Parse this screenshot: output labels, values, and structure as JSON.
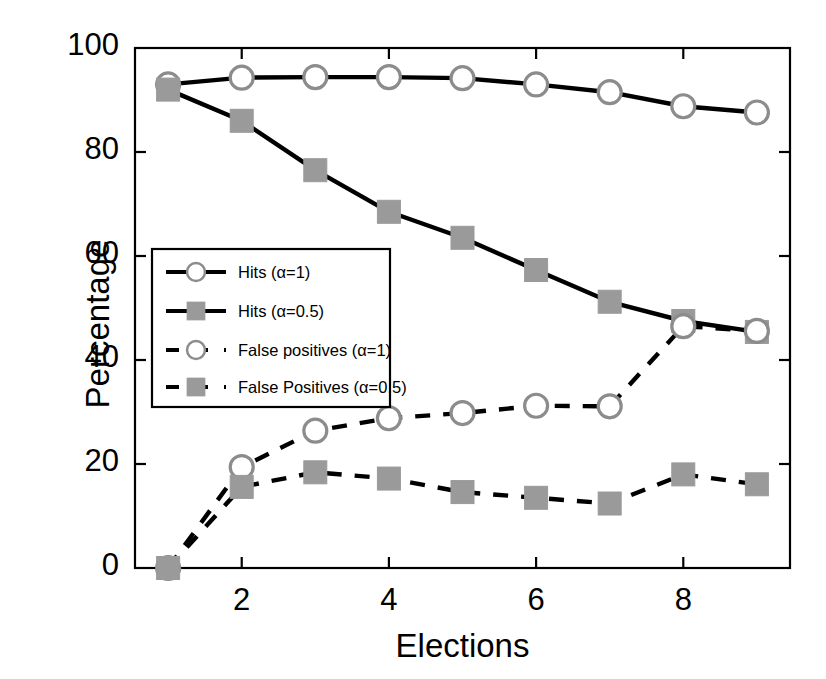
{
  "chart_data": {
    "type": "line",
    "title": "",
    "xlabel": "Elections",
    "ylabel": "Percentage",
    "xlim": [
      0.55,
      9.45
    ],
    "ylim": [
      0,
      100
    ],
    "xticks": [
      2,
      4,
      6,
      8
    ],
    "yticks": [
      0,
      20,
      40,
      60,
      80,
      100
    ],
    "grid": false,
    "legend_position": "center-left",
    "x": [
      1,
      2,
      3,
      4,
      5,
      6,
      7,
      8,
      9
    ],
    "series": [
      {
        "name": "Hits (α=1)",
        "marker": "circle",
        "linestyle": "solid",
        "color": "#000000",
        "marker_face": "#ffffff",
        "marker_edge": "#8c8c8c",
        "values": [
          93,
          94.3,
          94.4,
          94.4,
          94.2,
          93,
          91.5,
          88.8,
          87.6
        ]
      },
      {
        "name": "Hits (α=0.5)",
        "marker": "square",
        "linestyle": "solid",
        "color": "#000000",
        "marker_face": "#9a9a9a",
        "marker_edge": "#9a9a9a",
        "values": [
          92,
          86,
          76.5,
          68.5,
          63.5,
          57.3,
          51.2,
          47.5,
          45.4
        ]
      },
      {
        "name": "False positives (α=1)",
        "marker": "circle",
        "linestyle": "dashed",
        "color": "#000000",
        "marker_face": "#ffffff",
        "marker_edge": "#8c8c8c",
        "values": [
          0,
          19.4,
          26.4,
          28.8,
          29.8,
          31.2,
          31.1,
          46.5,
          45.6
        ]
      },
      {
        "name": "False Positives (α=0.5)",
        "marker": "square",
        "linestyle": "dashed",
        "color": "#000000",
        "marker_face": "#9a9a9a",
        "marker_edge": "#9a9a9a",
        "values": [
          0,
          15.6,
          18.4,
          17.2,
          14.6,
          13.5,
          12.4,
          18,
          16.1
        ]
      }
    ]
  },
  "axes": {
    "ylabel": "Percentage",
    "xlabel": "Elections",
    "ytick_labels": [
      "0",
      "20",
      "40",
      "60",
      "80",
      "100"
    ],
    "xtick_labels": [
      "2",
      "4",
      "6",
      "8"
    ]
  },
  "legend": {
    "entries": [
      {
        "label": "Hits (α=1)"
      },
      {
        "label": "Hits (α=0.5)"
      },
      {
        "label": "False positives (α=1)"
      },
      {
        "label": "False Positives (α=0.5)"
      }
    ]
  },
  "colors": {
    "line": "#000000",
    "marker_gray": "#9a9a9a",
    "marker_ring": "#8c8c8c",
    "axis": "#000000",
    "background": "#ffffff"
  }
}
